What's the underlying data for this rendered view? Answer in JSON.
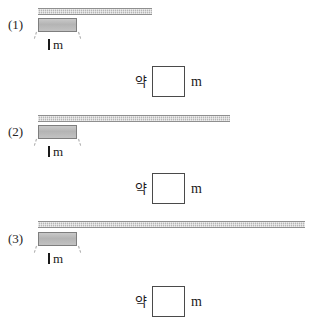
{
  "worksheet": {
    "unit_label_value": "1",
    "unit_label_unit": "m",
    "answer_prefix": "약",
    "answer_unit": "m",
    "answer_value": "",
    "colors": {
      "bar_fill": "#b5b5b5",
      "bar_border": "#8f8f8f",
      "block_fill": "#b4b4b4",
      "block_border": "#7e7e7e",
      "box_border": "#4a4a4a",
      "text": "#1a1a1a",
      "background": "#ffffff"
    },
    "problems": [
      {
        "number": "(1)",
        "unit_label_value": "1",
        "unit_label_unit": "m",
        "answer_prefix": "약",
        "answer_unit": "m",
        "answer_value": "",
        "bar_length_px": 114,
        "unit_block_length_px": 39,
        "bar_length_in_units": 2.9
      },
      {
        "number": "(2)",
        "unit_label_value": "1",
        "unit_label_unit": "m",
        "answer_prefix": "약",
        "answer_unit": "m",
        "answer_value": "",
        "bar_length_px": 192,
        "unit_block_length_px": 39,
        "bar_length_in_units": 4.9
      },
      {
        "number": "(3)",
        "unit_label_value": "1",
        "unit_label_unit": "m",
        "answer_prefix": "약",
        "answer_unit": "m",
        "answer_value": "",
        "bar_length_px": 267,
        "unit_block_length_px": 39,
        "bar_length_in_units": 6.8
      }
    ]
  }
}
